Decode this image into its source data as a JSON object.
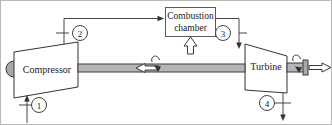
{
  "figure": {
    "name": "gas-turbine-brayton-cycle-schematic",
    "width": 332,
    "height": 125,
    "background": "#ffffff",
    "border_color": "#b9b9b9"
  },
  "devices": {
    "compressor": {
      "label": "Compressor",
      "shape": "trapezoid-widening-right",
      "fill": "#ffffff",
      "stroke": "#333333"
    },
    "turbine": {
      "label": "Turbine",
      "shape": "trapezoid-narrowing-right",
      "fill": "#ffffff",
      "stroke": "#333333"
    },
    "combustion_chamber": {
      "label_line1": "Combustion",
      "label_line2": "chamber",
      "shape": "rectangle",
      "fill": "#ffffff",
      "stroke": "#5a5a5a"
    }
  },
  "stations": [
    {
      "id": "1",
      "label": "1",
      "position": "compressor-inlet",
      "flow": "air-in"
    },
    {
      "id": "2",
      "label": "2",
      "position": "compressor-exit-to-combustor",
      "flow": "compressed-air"
    },
    {
      "id": "3",
      "label": "3",
      "position": "combustor-exit-to-turbine",
      "flow": "hot-gas"
    },
    {
      "id": "4",
      "label": "4",
      "position": "turbine-exit",
      "flow": "exhaust-out"
    }
  ],
  "flows": {
    "fuel_input": {
      "arrow": "hollow-up-arrow",
      "target": "combustion_chamber"
    },
    "shaft_work_internal": {
      "arrow": "hollow-left-arrow",
      "target": "compressor"
    },
    "net_work_output": {
      "arrow": "hollow-right-arrow",
      "target": "external-load"
    },
    "rotation_left": {
      "arrow": "curved-rotation-arrow"
    },
    "rotation_right": {
      "arrow": "curved-rotation-arrow"
    }
  },
  "shaft": {
    "name": "connecting-shaft",
    "fill": "#b5b5b5",
    "stroke": "#3a3a3a"
  }
}
